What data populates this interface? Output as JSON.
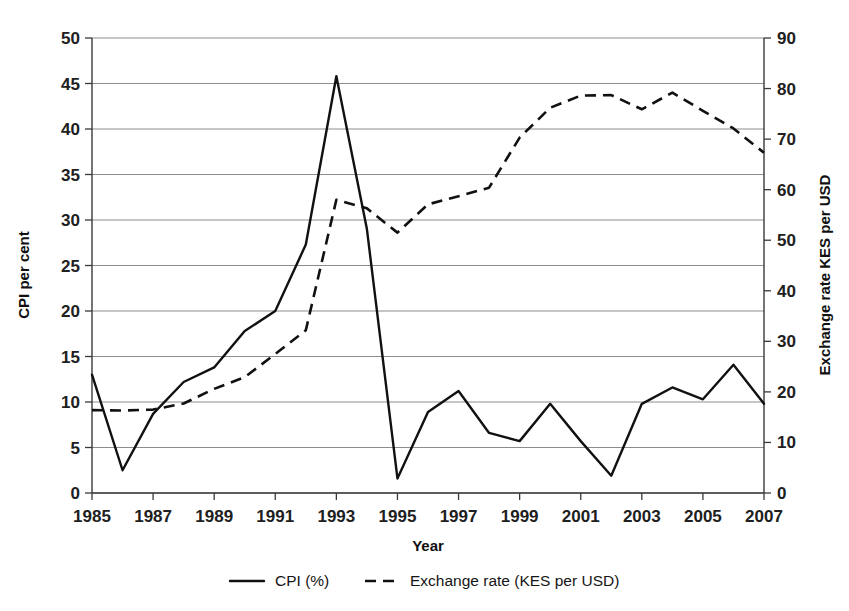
{
  "chart_data": {
    "type": "line",
    "title": "",
    "xlabel": "Year",
    "ylabel": "CPI per cent",
    "y2label": "Exchange rate KES per USD",
    "grid": true,
    "legend_position": "bottom",
    "xlim": [
      1985,
      2007
    ],
    "ylim": [
      0,
      50
    ],
    "y2lim": [
      0,
      90
    ],
    "x": [
      1985,
      1986,
      1987,
      1988,
      1989,
      1990,
      1991,
      1992,
      1993,
      1994,
      1995,
      1996,
      1997,
      1998,
      1999,
      2000,
      2001,
      2002,
      2003,
      2004,
      2005,
      2006,
      2007
    ],
    "xtick_labels": [
      "1985",
      "1987",
      "1989",
      "1991",
      "1993",
      "1995",
      "1997",
      "1999",
      "2001",
      "2003",
      "2005",
      "2007"
    ],
    "xticks": [
      1985,
      1987,
      1989,
      1991,
      1993,
      1995,
      1997,
      1999,
      2001,
      2003,
      2005,
      2007
    ],
    "ytick_labels": [
      "0",
      "5",
      "10",
      "15",
      "20",
      "25",
      "30",
      "35",
      "40",
      "45",
      "50"
    ],
    "yticks": [
      0,
      5,
      10,
      15,
      20,
      25,
      30,
      35,
      40,
      45,
      50
    ],
    "y2tick_labels": [
      "0",
      "10",
      "20",
      "30",
      "40",
      "50",
      "60",
      "70",
      "80",
      "90"
    ],
    "y2ticks": [
      0,
      10,
      20,
      30,
      40,
      50,
      60,
      70,
      80,
      90
    ],
    "series": [
      {
        "name": "CPI (%)",
        "axis": "left",
        "style": "solid",
        "color": "#111111",
        "values": [
          13.0,
          2.5,
          8.7,
          12.2,
          13.8,
          17.8,
          20.0,
          27.3,
          45.8,
          29.0,
          1.6,
          8.9,
          11.2,
          6.6,
          5.7,
          9.8,
          5.7,
          1.9,
          9.8,
          11.6,
          10.3,
          14.1,
          9.8
        ]
      },
      {
        "name": "Exchange rate (KES per USD)",
        "axis": "right",
        "style": "dashed",
        "color": "#111111",
        "values": [
          16.4,
          16.3,
          16.5,
          17.7,
          20.6,
          22.9,
          27.5,
          32.2,
          58.0,
          56.3,
          51.5,
          57.1,
          58.7,
          60.4,
          70.3,
          76.2,
          78.6,
          78.7,
          75.9,
          79.2,
          75.6,
          72.1,
          67.3
        ]
      }
    ]
  },
  "legend": {
    "items": [
      {
        "label": "CPI (%)",
        "style": "solid"
      },
      {
        "label": "Exchange rate (KES per USD)",
        "style": "dashed"
      }
    ]
  },
  "axes": {
    "left_title": "CPI per cent",
    "right_title": "Exchange rate KES per USD",
    "bottom_title": "Year"
  },
  "colors": {
    "series": "#111111",
    "grid": "#8d8d8d",
    "axis": "#3a3a3a",
    "background": "#ffffff"
  }
}
